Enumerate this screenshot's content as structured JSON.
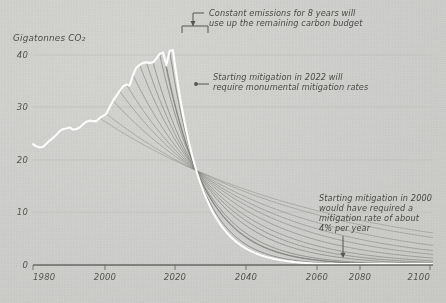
{
  "chart_data": {
    "type": "line",
    "title": "",
    "xlabel": "",
    "ylabel": "Gigatonnes CO₂",
    "xlim": [
      1980,
      2100
    ],
    "ylim": [
      0,
      44
    ],
    "xticks": [
      1980,
      2000,
      2020,
      2040,
      2060,
      2080,
      2100
    ],
    "xticklabels": [
      "1980",
      "2000",
      "2020",
      "2040",
      "2060",
      "2080",
      "2100"
    ],
    "yticks": [
      0,
      10,
      20,
      30,
      40
    ],
    "yticklabels": [
      "0",
      "10",
      "20",
      "30",
      "40"
    ],
    "grid": "horizontal",
    "legend": "none",
    "series": [
      {
        "name": "Historical emissions",
        "color": "#ffffff",
        "emphasis": "high",
        "x": [
          1980,
          1981,
          1982,
          1983,
          1984,
          1985,
          1986,
          1987,
          1988,
          1989,
          1990,
          1991,
          1992,
          1993,
          1994,
          1995,
          1996,
          1997,
          1998,
          1999,
          2000,
          2001,
          2002,
          2003,
          2004,
          2005,
          2006,
          2007,
          2008,
          2009,
          2010,
          2011,
          2012,
          2013,
          2014,
          2015,
          2016,
          2017,
          2018,
          2019,
          2020,
          2021,
          2022
        ],
        "y": [
          23.0,
          22.6,
          22.4,
          22.5,
          23.1,
          23.7,
          24.2,
          24.8,
          25.5,
          25.9,
          26.0,
          26.2,
          25.8,
          25.9,
          26.2,
          26.8,
          27.3,
          27.5,
          27.4,
          27.4,
          28.0,
          28.4,
          28.8,
          30.1,
          31.3,
          32.2,
          33.1,
          34.0,
          34.4,
          34.2,
          36.2,
          37.6,
          38.1,
          38.5,
          38.6,
          38.5,
          38.6,
          39.3,
          40.2,
          40.5,
          38.0,
          40.8,
          40.9
        ]
      },
      {
        "name": "Mitigation pathway starting 2000",
        "color": "#6f6e6a",
        "start_year": 2000,
        "rate_percent_per_year": 4
      },
      {
        "name": "Mitigation pathway starting 2022",
        "color": "#ffffff",
        "start_year": 2022,
        "emphasis": "high"
      }
    ],
    "pathway_start_years": [
      2000,
      2002,
      2004,
      2006,
      2008,
      2010,
      2012,
      2014,
      2016,
      2018,
      2019,
      2020,
      2021,
      2022
    ],
    "convergence_point": {
      "x": 2029,
      "y": 18
    },
    "annotations": [
      {
        "id": "carbon-budget",
        "text_lines": [
          "Constant emissions for 8 years will",
          "use up the remaining carbon budget"
        ],
        "marker": "bracket-with-arrow",
        "bracket_span_years": [
          2022,
          2030
        ]
      },
      {
        "id": "mitigation-2022",
        "text_lines": [
          "Starting mitigation in 2022 will",
          "require monumental mitigation rates"
        ],
        "marker": "leader-line-dot"
      },
      {
        "id": "mitigation-2000",
        "text_lines": [
          "Starting mitigation in 2000",
          "would have required a",
          "mitigation rate of about",
          "4% per year"
        ],
        "marker": "down-arrow"
      }
    ]
  },
  "colors": {
    "background": "#d2d2d0",
    "axis": "#6a6964",
    "gridline": "#c0c0bc",
    "highlight_line": "#ffffff",
    "pathway_line": "#6f6e6a",
    "text": "#4a4944"
  }
}
